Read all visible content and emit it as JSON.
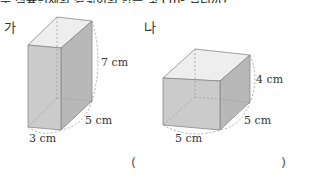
{
  "header": {
    "cut_text": "두 직육면체의 겉넓이의 합은 몇 cm² 입니까?"
  },
  "figures": [
    {
      "label": "가",
      "dims": {
        "height": "7 cm",
        "depth": "5 cm",
        "width": "3 cm"
      }
    },
    {
      "label": "나",
      "dims": {
        "height": "4 cm",
        "depth": "5 cm",
        "width": "5 cm"
      }
    }
  ],
  "answer": {
    "open": "(",
    "close": ")",
    "value": ""
  },
  "colors": {
    "front": "#c8c8c8",
    "side": "#b4b4b4",
    "top": "#ececec",
    "edge": "#777777"
  }
}
